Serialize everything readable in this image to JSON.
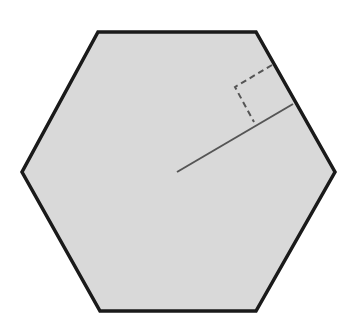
{
  "diagram": {
    "shape": "regular-hexagon",
    "fill_color": "#d9d9d9",
    "stroke_color": "#1a1a1a",
    "vertices": [
      [
        98,
        32
      ],
      [
        256,
        32
      ],
      [
        335,
        172
      ],
      [
        256,
        311
      ],
      [
        100,
        311
      ],
      [
        22,
        172
      ]
    ],
    "center": [
      177,
      172
    ],
    "apothem": {
      "from": [
        177,
        172
      ],
      "to": [
        293,
        104
      ],
      "color": "#555555"
    },
    "right_angle_marker": {
      "points": [
        [
          272,
          65
        ],
        [
          235,
          87
        ],
        [
          254,
          122
        ]
      ],
      "style": "dashed",
      "color": "#555555"
    }
  }
}
